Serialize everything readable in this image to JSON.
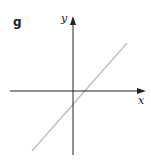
{
  "panel": {
    "label": "g"
  },
  "axes": {
    "x_label": "x",
    "y_label": "y",
    "axis_color": "#222222"
  },
  "line": {
    "description": "straight line with positive slope, x-intercept slightly positive, y-intercept slightly negative",
    "color": "#bbbbbb",
    "slope_sign": "positive",
    "x_intercept_sign": "positive",
    "y_intercept_sign": "negative"
  }
}
